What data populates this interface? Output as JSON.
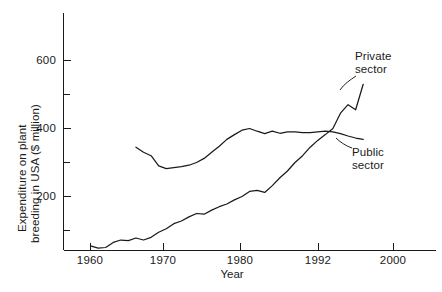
{
  "chart_data": {
    "type": "line",
    "title": "",
    "xlabel": "Year",
    "ylabel": "Expenditure on plant breeding in USA ($ million)",
    "ylabel_line_1": "Expenditure on plant",
    "ylabel_line_2": "breeding in USA ($ million)",
    "xlim": [
      1956.5,
      2004
    ],
    "ylim": [
      20,
      710
    ],
    "grid": false,
    "legend_position": "inline-annotation",
    "xticks": [
      1960,
      1970,
      1980,
      1992,
      2000
    ],
    "xtick_labels": [
      "1960",
      "1970",
      "1980",
      "1992",
      "2000"
    ],
    "yticks": [
      200,
      400,
      600
    ],
    "ytick_labels": [
      "200",
      "400",
      "600"
    ],
    "yticks_minor": [
      100,
      300,
      500,
      700
    ],
    "series": [
      {
        "name": "Private sector",
        "annotation_line_1": "Private",
        "annotation_line_2": "sector",
        "color": "#1a1a1a",
        "x": [
          1960,
          1961,
          1962,
          1963,
          1964,
          1965,
          1966,
          1967,
          1968,
          1969,
          1970,
          1971,
          1972,
          1973,
          1974,
          1975,
          1976,
          1977,
          1978,
          1979,
          1980,
          1981,
          1982,
          1983,
          1984,
          1985,
          1986,
          1987,
          1988,
          1989,
          1990,
          1991,
          1992,
          1993,
          1994,
          1995,
          1996
        ],
        "values": [
          55,
          48,
          50,
          65,
          72,
          70,
          78,
          72,
          80,
          95,
          105,
          120,
          128,
          140,
          150,
          148,
          160,
          170,
          178,
          190,
          200,
          215,
          218,
          212,
          232,
          255,
          275,
          300,
          320,
          345,
          365,
          382,
          400,
          445,
          470,
          455,
          530
        ]
      },
      {
        "name": "Public sector",
        "annotation_line_1": "Public",
        "annotation_line_2": "sector",
        "color": "#1a1a1a",
        "x": [
          1966,
          1967,
          1968,
          1969,
          1970,
          1971,
          1972,
          1973,
          1974,
          1975,
          1976,
          1977,
          1978,
          1979,
          1980,
          1981,
          1982,
          1983,
          1984,
          1985,
          1986,
          1987,
          1988,
          1989,
          1990,
          1991,
          1992,
          1993,
          1994,
          1995,
          1996
        ],
        "values": [
          345,
          330,
          320,
          290,
          282,
          285,
          288,
          292,
          300,
          312,
          330,
          348,
          368,
          382,
          395,
          400,
          392,
          385,
          392,
          386,
          390,
          390,
          388,
          388,
          390,
          392,
          390,
          385,
          378,
          372,
          368
        ]
      }
    ]
  },
  "annotations": {
    "private": {
      "line_1": "Private",
      "line_2": "sector"
    },
    "public": {
      "line_1": "Public",
      "line_2": "sector"
    }
  }
}
